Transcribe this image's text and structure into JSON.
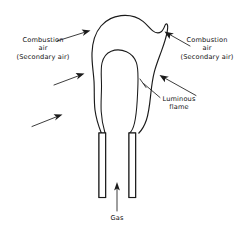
{
  "figure": {
    "type": "technical-line-diagram",
    "background_color": "#ffffff",
    "line_color": "#1a1a1a"
  },
  "labels": {
    "combustion_air_left": {
      "line1": "Combustion",
      "line2": "air",
      "line3": "(Secondary air)"
    },
    "combustion_air_right": {
      "line1": "Combustion",
      "line2": "air",
      "line3": "(Secondary air)"
    },
    "luminous_flame": {
      "line1": "Luminous",
      "line2": "flame"
    },
    "gas": {
      "line1": "Gas"
    }
  },
  "parts": {
    "flame_outer_name": "outer-flame-envelope",
    "flame_inner_name": "inner-luminous-flame-core",
    "burner_tube_left_name": "burner-tube-left",
    "burner_tube_right_name": "burner-tube-right",
    "gas_flow_arrow_name": "gas-flow-arrow"
  },
  "arrows": {
    "count": 5,
    "secondary_air_left_upper": "points up-right into flame",
    "secondary_air_left_middle": "points up-right into flame",
    "secondary_air_left_lower": "points up-right into flame base",
    "secondary_air_right_upper": "points up-left into flame",
    "secondary_air_right_lower": "points up-left into flame",
    "gas_flow": "points up into burner tube"
  }
}
